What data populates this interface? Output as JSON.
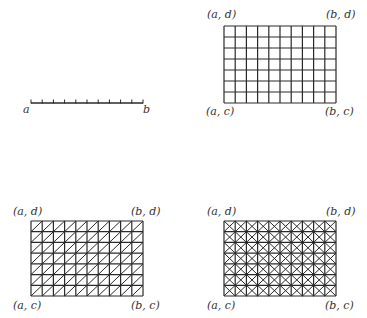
{
  "colors": {
    "stroke": "#2a2a2a",
    "background": "#ffffff",
    "text": "#333333"
  },
  "panels": [
    {
      "id": "interval",
      "type": "segment",
      "x0": 31,
      "x1": 143,
      "y": 103,
      "intervals": 10,
      "tick_height": 3.5,
      "labels": [
        {
          "text": "a",
          "x": 23,
          "y": 104
        },
        {
          "text": "b",
          "x": 143,
          "y": 104
        }
      ]
    },
    {
      "id": "rect-grid",
      "type": "grid",
      "x0": 224,
      "x1": 336,
      "y0": 26,
      "y1": 103,
      "cols": 10,
      "rows": 7,
      "diagonals": "none",
      "labels": [
        {
          "text": "(a, d)",
          "x": 207,
          "y": 9
        },
        {
          "text": "(b, d)",
          "x": 326,
          "y": 9
        },
        {
          "text": "(a, c)",
          "x": 206,
          "y": 106
        },
        {
          "text": "(b, c)",
          "x": 325,
          "y": 106
        }
      ]
    },
    {
      "id": "triangulated-grid",
      "type": "grid",
      "x0": 31,
      "x1": 143,
      "y0": 221,
      "y1": 296,
      "cols": 10,
      "rows": 7,
      "diagonals": "single",
      "labels": [
        {
          "text": "(a, d)",
          "x": 13,
          "y": 206
        },
        {
          "text": "(b, d)",
          "x": 131,
          "y": 206
        },
        {
          "text": "(a, c)",
          "x": 13,
          "y": 300
        },
        {
          "text": "(b, c)",
          "x": 131,
          "y": 300
        }
      ]
    },
    {
      "id": "cross-grid",
      "type": "grid",
      "x0": 224,
      "x1": 336,
      "y0": 221,
      "y1": 296,
      "cols": 10,
      "rows": 7,
      "diagonals": "cross",
      "labels": [
        {
          "text": "(a, d)",
          "x": 207,
          "y": 206
        },
        {
          "text": "(b, d)",
          "x": 326,
          "y": 206
        },
        {
          "text": "(a, c)",
          "x": 207,
          "y": 300
        },
        {
          "text": "(b, c)",
          "x": 325,
          "y": 300
        }
      ]
    }
  ]
}
